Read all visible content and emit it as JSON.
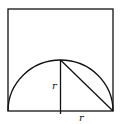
{
  "diagram": {
    "labels": {
      "vertical_radius": "r",
      "horizontal_radius": "r"
    },
    "colors": {
      "stroke": "#111111",
      "background": "#ffffff"
    }
  }
}
